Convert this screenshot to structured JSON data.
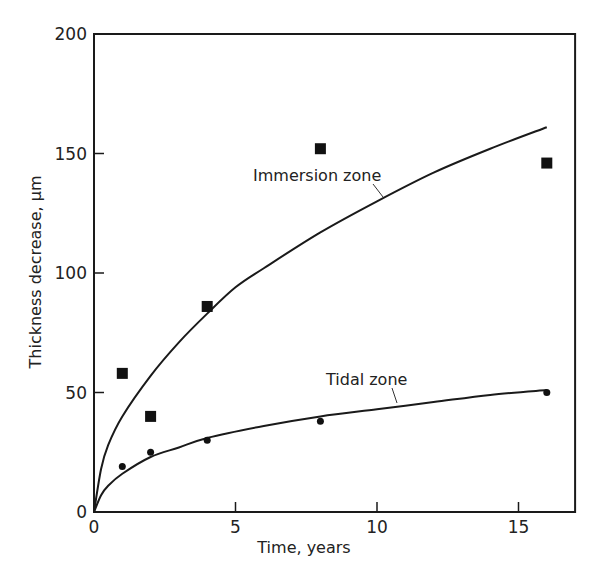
{
  "chart_data": {
    "type": "scatter",
    "title": "",
    "xlabel": "Time, years",
    "ylabel": "Thickness decrease, μm",
    "xlim": [
      0,
      17
    ],
    "ylim": [
      0,
      200
    ],
    "xticks": [
      0,
      5,
      10,
      15
    ],
    "yticks": [
      0,
      50,
      100,
      150,
      200
    ],
    "grid": false,
    "legend": null,
    "series": [
      {
        "name": "Immersion zone",
        "marker": "square",
        "points": [
          {
            "x": 1,
            "y": 58
          },
          {
            "x": 2,
            "y": 40
          },
          {
            "x": 4,
            "y": 86
          },
          {
            "x": 8,
            "y": 152
          },
          {
            "x": 16,
            "y": 146
          }
        ],
        "fit_curve": [
          {
            "x": 0,
            "y": 0
          },
          {
            "x": 0.25,
            "y": 18
          },
          {
            "x": 0.5,
            "y": 28
          },
          {
            "x": 1,
            "y": 40
          },
          {
            "x": 2,
            "y": 57
          },
          {
            "x": 3,
            "y": 71
          },
          {
            "x": 4,
            "y": 83
          },
          {
            "x": 5,
            "y": 94
          },
          {
            "x": 6,
            "y": 102
          },
          {
            "x": 8,
            "y": 117
          },
          {
            "x": 10,
            "y": 130
          },
          {
            "x": 12,
            "y": 142
          },
          {
            "x": 14,
            "y": 152
          },
          {
            "x": 16,
            "y": 161
          }
        ]
      },
      {
        "name": "Tidal zone",
        "marker": "circle",
        "points": [
          {
            "x": 1,
            "y": 19
          },
          {
            "x": 2,
            "y": 25
          },
          {
            "x": 4,
            "y": 30
          },
          {
            "x": 8,
            "y": 38
          },
          {
            "x": 16,
            "y": 50
          }
        ],
        "fit_curve": [
          {
            "x": 0,
            "y": 0
          },
          {
            "x": 0.25,
            "y": 7
          },
          {
            "x": 0.5,
            "y": 11
          },
          {
            "x": 1,
            "y": 16
          },
          {
            "x": 2,
            "y": 23
          },
          {
            "x": 3,
            "y": 27
          },
          {
            "x": 4,
            "y": 31
          },
          {
            "x": 6,
            "y": 36
          },
          {
            "x": 8,
            "y": 40
          },
          {
            "x": 10,
            "y": 43
          },
          {
            "x": 12,
            "y": 46
          },
          {
            "x": 14,
            "y": 49
          },
          {
            "x": 16,
            "y": 51
          }
        ]
      }
    ],
    "annotations": [
      {
        "text": "Immersion zone",
        "x": 253,
        "y": 181,
        "leader": [
          373,
          184,
          383,
          197
        ]
      },
      {
        "text": "Tidal zone",
        "x": 326,
        "y": 385,
        "leader": [
          392,
          388,
          397,
          403
        ]
      }
    ]
  }
}
